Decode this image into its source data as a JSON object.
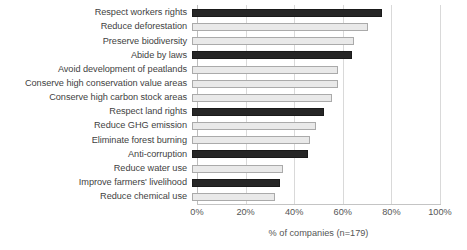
{
  "chart_data": {
    "type": "bar",
    "orientation": "horizontal",
    "title": "",
    "xlabel": "% of companies (n=179)",
    "ylabel": "",
    "xlim": [
      0,
      100
    ],
    "xticks": [
      "0%",
      "20%",
      "40%",
      "60%",
      "80%",
      "100%"
    ],
    "xtick_values": [
      0,
      20,
      40,
      60,
      80,
      100
    ],
    "grid": true,
    "legend": false,
    "categories": [
      "Respect workers rights",
      "Reduce deforestation",
      "Preserve biodiversity",
      "Abide by laws",
      "Avoid development of peatlands",
      "Conserve high conservation value areas",
      "Conserve high carbon stock areas",
      "Respect land rights",
      "Reduce GHG emission",
      "Eliminate forest burning",
      "Anti-corruption",
      "Reduce water use",
      "Improve farmers' livelihood",
      "Reduce chemical use"
    ],
    "values": [
      69,
      64,
      59,
      58,
      53,
      53,
      51,
      48,
      45,
      43,
      42,
      33,
      32,
      30
    ],
    "bar_styles": [
      "dark",
      "light",
      "light",
      "dark",
      "light",
      "light",
      "light",
      "dark",
      "light",
      "light",
      "dark",
      "light",
      "dark",
      "light"
    ],
    "colors": {
      "dark_bar": "#262626",
      "light_bar": "#e9e9e9",
      "light_bar_border": "#aaaaaa",
      "gridline": "#d9d9d9",
      "axis_text": "#555555",
      "label_text": "#3f3f3f",
      "background": "#ffffff"
    }
  }
}
